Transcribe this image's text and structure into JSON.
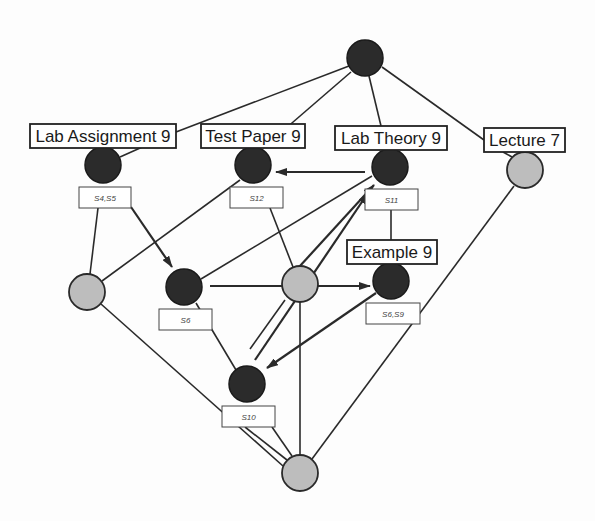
{
  "diagram": {
    "type": "concept-lattice",
    "colors": {
      "dark_node": "#2b2b2b",
      "light_node": "#bdbdbd",
      "edge": "#2a2a2a",
      "background": "#fdfdfd"
    },
    "nodes": [
      {
        "id": "top",
        "x": 365,
        "y": 58,
        "r": 18,
        "style": "dark"
      },
      {
        "id": "lab-assignment-9",
        "x": 103,
        "y": 165,
        "r": 18,
        "style": "dark",
        "label": "Lab Assignment 9",
        "sublabel": "S4,S5"
      },
      {
        "id": "test-paper-9",
        "x": 253,
        "y": 165,
        "r": 18,
        "style": "dark",
        "label": "Test Paper 9",
        "sublabel": "S12"
      },
      {
        "id": "lab-theory-9",
        "x": 390,
        "y": 167,
        "r": 18,
        "style": "dark",
        "label": "Lab Theory 9",
        "sublabel": "S11"
      },
      {
        "id": "lecture-7",
        "x": 525,
        "y": 170,
        "r": 18,
        "style": "light",
        "label": "Lecture 7"
      },
      {
        "id": "left-gray",
        "x": 87,
        "y": 292,
        "r": 18,
        "style": "light"
      },
      {
        "id": "s6",
        "x": 184,
        "y": 287,
        "r": 18,
        "style": "dark",
        "sublabel": "S6"
      },
      {
        "id": "center-gray",
        "x": 300,
        "y": 284,
        "r": 18,
        "style": "light"
      },
      {
        "id": "example-9",
        "x": 391,
        "y": 281,
        "r": 18,
        "style": "dark",
        "label": "Example 9",
        "sublabel": "S6,S9"
      },
      {
        "id": "s10",
        "x": 247,
        "y": 384,
        "r": 18,
        "style": "dark",
        "sublabel": "S10"
      },
      {
        "id": "bottom",
        "x": 300,
        "y": 473,
        "r": 18,
        "style": "light"
      }
    ],
    "labels": [
      {
        "node": "lab-assignment-9",
        "text": "Lab Assignment 9",
        "x": 30,
        "y": 124,
        "w": 146,
        "h": 24
      },
      {
        "node": "test-paper-9",
        "text": "Test Paper 9",
        "x": 201,
        "y": 124,
        "w": 104,
        "h": 24
      },
      {
        "node": "lab-theory-9",
        "text": "Lab Theory 9",
        "x": 335,
        "y": 126,
        "w": 112,
        "h": 24
      },
      {
        "node": "lecture-7",
        "text": "Lecture 7",
        "x": 484,
        "y": 128,
        "w": 81,
        "h": 24
      },
      {
        "node": "example-9",
        "text": "Example 9",
        "x": 347,
        "y": 240,
        "w": 90,
        "h": 24
      }
    ],
    "sublabels": [
      {
        "node": "lab-assignment-9",
        "text": "S4,S5",
        "x": 79,
        "y": 187,
        "w": 52,
        "h": 21
      },
      {
        "node": "test-paper-9",
        "text": "S12",
        "x": 230,
        "y": 187,
        "w": 53,
        "h": 21
      },
      {
        "node": "lab-theory-9",
        "text": "S11",
        "x": 365,
        "y": 189,
        "w": 53,
        "h": 21
      },
      {
        "node": "s6",
        "text": "S6",
        "x": 159,
        "y": 309,
        "w": 53,
        "h": 21
      },
      {
        "node": "example-9",
        "text": "S6,S9",
        "x": 366,
        "y": 303,
        "w": 54,
        "h": 21
      },
      {
        "node": "s10",
        "text": "S10",
        "x": 222,
        "y": 406,
        "w": 53,
        "h": 21
      }
    ],
    "edges": [
      {
        "from": "top",
        "to": "lab-assignment-9",
        "x1": 349,
        "y1": 66,
        "x2": 176,
        "y2": 132
      },
      {
        "from": "lab-assignment-9",
        "to": "label-line",
        "x1": 176,
        "y1": 132,
        "x2": 120,
        "y2": 157
      },
      {
        "from": "top",
        "to": "test-paper-9",
        "x1": 351,
        "y1": 72,
        "x2": 263,
        "y2": 148
      },
      {
        "from": "top",
        "to": "lab-theory-9",
        "x1": 369,
        "y1": 76,
        "x2": 381,
        "y2": 126
      },
      {
        "from": "top",
        "to": "lecture-7",
        "x1": 382,
        "y1": 67,
        "x2": 484,
        "y2": 140
      },
      {
        "from": "lecture-7",
        "to": "lecture-node",
        "x1": 503,
        "y1": 152,
        "x2": 512,
        "y2": 157
      },
      {
        "from": "lab-assignment-9",
        "to": "left-gray",
        "x1": 98,
        "y1": 208,
        "x2": 90,
        "y2": 274
      },
      {
        "from": "test-paper-9",
        "to": "left-gray",
        "x1": 240,
        "y1": 180,
        "x2": 102,
        "y2": 281
      },
      {
        "from": "test-paper-9",
        "to": "center-gray",
        "x1": 270,
        "y1": 208,
        "x2": 293,
        "y2": 267
      },
      {
        "from": "lab-theory-9",
        "to": "s6",
        "x1": 372,
        "y1": 176,
        "x2": 201,
        "y2": 279
      },
      {
        "from": "lab-theory-9",
        "to": "example-9",
        "x1": 391,
        "y1": 210,
        "x2": 391,
        "y2": 240
      },
      {
        "from": "lecture-7",
        "to": "bottom",
        "x1": 514,
        "y1": 186,
        "x2": 312,
        "y2": 459
      },
      {
        "from": "left-gray",
        "to": "bottom",
        "x1": 101,
        "y1": 304,
        "x2": 283,
        "y2": 466
      },
      {
        "from": "s6",
        "to": "s10",
        "x1": 196,
        "y1": 303,
        "x2": 236,
        "y2": 370
      },
      {
        "from": "center-gray",
        "to": "s10-dir",
        "x1": 285,
        "y1": 300,
        "x2": 250,
        "y2": 349
      },
      {
        "from": "center-gray",
        "to": "bottom",
        "x1": 300,
        "y1": 302,
        "x2": 300,
        "y2": 455
      },
      {
        "from": "s10",
        "to": "bottom",
        "x1": 245,
        "y1": 427,
        "x2": 287,
        "y2": 460
      },
      {
        "from": "s10",
        "to": "bottom-2",
        "x1": 272,
        "y1": 427,
        "x2": 292,
        "y2": 456
      }
    ],
    "arrows": [
      {
        "from": "lab-theory-9",
        "to": "test-paper-9",
        "x1": 365,
        "y1": 172,
        "x2": 276,
        "y2": 172
      },
      {
        "from": "lab-assignment-9",
        "to": "s6",
        "x1": 131,
        "y1": 207,
        "x2": 172,
        "y2": 267
      },
      {
        "from": "s6",
        "to": "example-9",
        "x1": 210,
        "y1": 286,
        "x2": 370,
        "y2": 286
      },
      {
        "from": "center-gray",
        "to": "lab-theory-9",
        "x1": 289,
        "y1": 278,
        "x2": 374,
        "y2": 185
      },
      {
        "from": "s10-line",
        "to": "lab-theory-9",
        "x1": 255,
        "y1": 360,
        "x2": 368,
        "y2": 193
      },
      {
        "from": "example-9",
        "to": "s10",
        "x1": 376,
        "y1": 293,
        "x2": 267,
        "y2": 368
      }
    ]
  }
}
